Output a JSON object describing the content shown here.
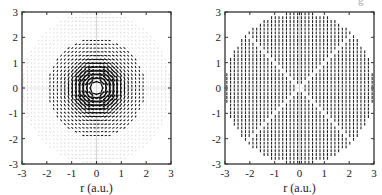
{
  "figure": {
    "top_right_fragment": "g"
  },
  "chart_data": [
    {
      "type": "scatter",
      "subtype": "vector-field",
      "title": "",
      "xlabel": "r (a.u.)",
      "ylabel": "",
      "xlim": [
        -3,
        3
      ],
      "ylim": [
        -3,
        3
      ],
      "xticks": [
        "-3",
        "-2",
        "-1",
        "0",
        "1",
        "2",
        "3"
      ],
      "yticks": [
        "-3",
        "-2",
        "-1",
        "0",
        "1",
        "2",
        "3"
      ],
      "grid": false,
      "legend": null,
      "field": {
        "pattern": "azimuthal-vortex",
        "grid_spacing": 0.15,
        "outer_radius_faint": 3.0,
        "inner_radius_dark": 1.95,
        "core_hole_radius": 0.2,
        "strong_ring_radius": 0.6,
        "color_dark": "#111111",
        "color_faint": "#c8c8c8"
      }
    },
    {
      "type": "scatter",
      "subtype": "vector-field",
      "title": "",
      "xlabel": "r (a.u.)",
      "ylabel": "",
      "xlim": [
        -3,
        3
      ],
      "ylim": [
        -3,
        3
      ],
      "xticks": [
        "-3",
        "-2",
        "-1",
        "0",
        "1",
        "2",
        "3"
      ],
      "yticks": [
        "-3",
        "-2",
        "-1",
        "0",
        "1",
        "2",
        "3"
      ],
      "grid": false,
      "legend": null,
      "field": {
        "pattern": "radial-disk-with-nodal-lines",
        "grid_spacing": 0.15,
        "outer_radius": 3.0,
        "nodal_line_angles_deg": [
          0,
          45,
          90,
          135
        ],
        "color_dark": "#222222",
        "color_faint": "#bbbbbb"
      }
    }
  ]
}
